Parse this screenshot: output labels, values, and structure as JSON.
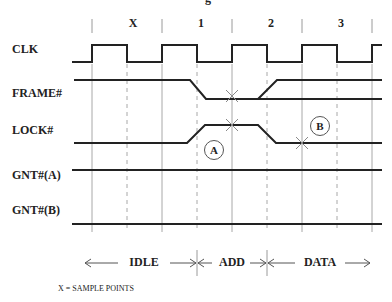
{
  "diagram": {
    "title_fragment": "g",
    "phase_labels": [
      "X",
      "1",
      "2",
      "3"
    ],
    "signals": [
      {
        "name": "CLK"
      },
      {
        "name": "FRAME#"
      },
      {
        "name": "LOCK#"
      },
      {
        "name": "GNT#(A)"
      },
      {
        "name": "GNT#(B)"
      }
    ],
    "markers": [
      {
        "label": "A"
      },
      {
        "label": "B"
      }
    ],
    "periods": [
      {
        "label": "IDLE"
      },
      {
        "label": "ADD"
      },
      {
        "label": "DATA"
      }
    ],
    "footnote": "X = SAMPLE POINTS",
    "colors": {
      "signal_line": "#222222",
      "solid_gridline": "#9a9a9a",
      "dashed_gridline": "#9a9a9a",
      "sample_mark": "#8a8a8a"
    }
  }
}
